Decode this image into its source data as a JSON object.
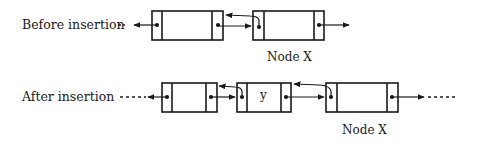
{
  "diagram": {
    "before": {
      "label": "Before insertion",
      "node_x_label": "Node X"
    },
    "after": {
      "label": "After insertion",
      "inserted_value": "y",
      "node_x_label": "Node X"
    },
    "colors": {
      "stroke": "#1a1a1a",
      "background": "#ffffff"
    }
  }
}
